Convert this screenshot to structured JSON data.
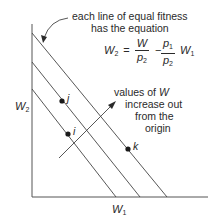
{
  "annotation": {
    "line1": "each line of equal fitness",
    "line2": "has the equation"
  },
  "equation": {
    "lhs_var": "W",
    "lhs_sub": "2",
    "equals": "=",
    "frac1_num": "W",
    "frac1_den_var": "p",
    "frac1_den_sub": "2",
    "minus": "−",
    "frac2_num_var": "p",
    "frac2_num_sub": "1",
    "frac2_den_var": "p",
    "frac2_den_sub": "2",
    "rhs_var": "W",
    "rhs_sub": "1"
  },
  "axes": {
    "y_label_var": "W",
    "y_label_sub": "2",
    "x_label_var": "W",
    "x_label_sub": "1"
  },
  "points": [
    {
      "label": "j"
    },
    {
      "label": "i"
    },
    {
      "label": "k"
    }
  ],
  "direction_note": {
    "line1_pre": "values of ",
    "line1_var": "W",
    "line2": "increase out",
    "line3": "from the",
    "line4": "origin"
  },
  "colors": {
    "ink": "#2a2a2a",
    "axis": "#555555",
    "line": "#444444"
  }
}
